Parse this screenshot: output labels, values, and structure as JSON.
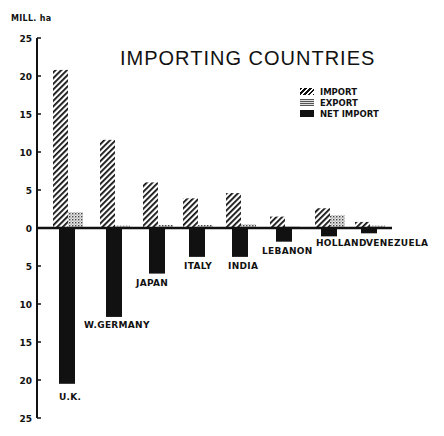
{
  "chart_data": {
    "type": "bar",
    "title": "IMPORTING COUNTRIES",
    "xlabel": "",
    "ylabel": "MILL. ha",
    "ylim": [
      -25,
      25
    ],
    "yticks": [
      25,
      20,
      15,
      10,
      5,
      0,
      5,
      10,
      15,
      20,
      25
    ],
    "grid": false,
    "legend_position": "upper right",
    "categories": [
      "U.K.",
      "W.GERMANY",
      "JAPAN",
      "ITALY",
      "INDIA",
      "LEBANON",
      "HOLLAND",
      "VENEZUELA"
    ],
    "series": [
      {
        "name": "IMPORT",
        "values": [
          20.8,
          11.6,
          6.0,
          3.9,
          4.6,
          1.5,
          2.6,
          0.8
        ]
      },
      {
        "name": "EXPORT",
        "values": [
          2.1,
          0.3,
          0.4,
          0.4,
          0.5,
          0.2,
          1.7,
          0.3
        ]
      },
      {
        "name": "NET IMPORT",
        "values": [
          -20.5,
          -11.7,
          -6.0,
          -3.8,
          -3.8,
          -1.8,
          -1.1,
          -0.7
        ]
      }
    ]
  },
  "labels": {
    "title": "IMPORTING COUNTRIES",
    "ylabel": "MILL. ha",
    "legend": [
      "IMPORT",
      "EXPORT",
      "NET IMPORT"
    ]
  }
}
